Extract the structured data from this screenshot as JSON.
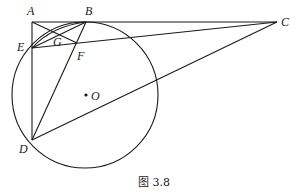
{
  "figure": {
    "caption": "图 3.8",
    "points": {
      "A": {
        "label": "A",
        "x": 32,
        "y": 22
      },
      "B": {
        "label": "B",
        "x": 86,
        "y": 22
      },
      "C": {
        "label": "C",
        "x": 277,
        "y": 22
      },
      "D": {
        "label": "D",
        "x": 32,
        "y": 140
      },
      "E": {
        "label": "E",
        "x": 32,
        "y": 48
      },
      "F": {
        "label": "F",
        "x": 77,
        "y": 43
      },
      "G": {
        "label": "G",
        "x": 58,
        "y": 38
      },
      "O": {
        "label": "O",
        "x": 86,
        "y": 95
      }
    },
    "circle": {
      "center": "O",
      "radius": 73
    },
    "segments": [
      "AB",
      "BC",
      "AE",
      "ED",
      "EC",
      "EB",
      "AF",
      "BD",
      "DC",
      "arc EB"
    ]
  }
}
